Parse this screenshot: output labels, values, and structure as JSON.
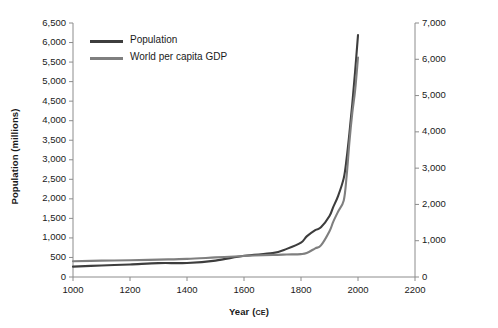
{
  "chart_data": {
    "type": "line",
    "title": "",
    "xlabel": "Year",
    "xlabel_suffix": "CE",
    "xlabel_full": "Year (CE)",
    "xlim": [
      1000,
      2200
    ],
    "xticks": [
      "1000",
      "1200",
      "1400",
      "1600",
      "1800",
      "2000",
      "2200"
    ],
    "xtick_values": [
      1000,
      1200,
      1400,
      1600,
      1800,
      2000,
      2200
    ],
    "grid": false,
    "legend_position": "upper left",
    "axes": [
      {
        "side": "left",
        "ylabel": "Population (millions)",
        "ylim": [
          0,
          6500
        ],
        "yticks": [
          "0",
          "500",
          "1,000",
          "1,500",
          "2,000",
          "2,500",
          "3,000",
          "3,500",
          "4,000",
          "4,500",
          "5,000",
          "5,500",
          "6,000",
          "6,500"
        ],
        "ytick_values": [
          0,
          500,
          1000,
          1500,
          2000,
          2500,
          3000,
          3500,
          4000,
          4500,
          5000,
          5500,
          6000,
          6500
        ]
      },
      {
        "side": "right",
        "ylabel": "World per capita GDP (1990 international dollars)",
        "ylim": [
          0,
          7000
        ],
        "yticks": [
          "0",
          "1,000",
          "2,000",
          "3,000",
          "4,000",
          "5,000",
          "6,000",
          "7,000"
        ],
        "ytick_values": [
          0,
          1000,
          2000,
          3000,
          4000,
          5000,
          6000,
          7000
        ]
      }
    ],
    "series": [
      {
        "name": "Population",
        "axis": "left",
        "color": "#3d3d3d",
        "x": [
          1000,
          1100,
          1200,
          1300,
          1400,
          1500,
          1600,
          1700,
          1750,
          1800,
          1820,
          1850,
          1870,
          1900,
          1913,
          1930,
          1950,
          1960,
          1970,
          1980,
          1990,
          2000
        ],
        "values": [
          265,
          295,
          320,
          355,
          360,
          420,
          545,
          610,
          720,
          880,
          1040,
          1200,
          1270,
          1560,
          1790,
          2070,
          2530,
          3030,
          3690,
          4430,
          5270,
          6190
        ]
      },
      {
        "name": "World per capita GDP",
        "axis": "right",
        "color": "#7f7f7f",
        "x": [
          1000,
          1100,
          1200,
          1300,
          1400,
          1500,
          1600,
          1700,
          1750,
          1800,
          1820,
          1850,
          1870,
          1900,
          1913,
          1930,
          1950,
          1960,
          1970,
          1980,
          1990,
          2000
        ],
        "values": [
          435,
          450,
          460,
          480,
          500,
          540,
          580,
          610,
          620,
          630,
          660,
          790,
          870,
          1260,
          1520,
          1800,
          2110,
          2770,
          3730,
          4520,
          5150,
          6050
        ]
      }
    ]
  },
  "legend": {
    "items": [
      {
        "label": "Population",
        "color": "#3d3d3d"
      },
      {
        "label": "World per capita GDP",
        "color": "#7f7f7f"
      }
    ]
  },
  "colors": {
    "population": "#3d3d3d",
    "gdp": "#7f7f7f",
    "axis": "#8c8c8c",
    "text": "#1a1a1a",
    "background": "#ffffff"
  }
}
